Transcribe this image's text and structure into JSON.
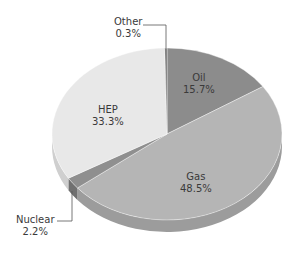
{
  "chart_data": {
    "type": "pie",
    "style": "3d",
    "title": "",
    "start_angle_deg": 0,
    "direction": "clockwise",
    "slices": [
      {
        "label": "Oil",
        "value": 15.7,
        "display": "15.7%",
        "color": "#8c8c8c",
        "side_color": "#6e6e6e"
      },
      {
        "label": "Gas",
        "value": 48.5,
        "display": "48.5%",
        "color": "#b5b5b5",
        "side_color": "#9c9c9c"
      },
      {
        "label": "Nuclear",
        "value": 2.2,
        "display": "2.2%",
        "color": "#8f8f8f",
        "side_color": "#707070"
      },
      {
        "label": "HEP",
        "value": 33.3,
        "display": "33.3%",
        "color": "#e8e8e8",
        "side_color": "#cfcfcf"
      },
      {
        "label": "Other",
        "value": 0.3,
        "display": "0.3%",
        "color": "#6a6a6a",
        "side_color": "#555555"
      }
    ],
    "callouts": [
      "Other",
      "Nuclear"
    ],
    "legend": "none"
  },
  "labels": {
    "oil": {
      "name": "Oil",
      "pct": "15.7%"
    },
    "gas": {
      "name": "Gas",
      "pct": "48.5%"
    },
    "nuclear": {
      "name": "Nuclear",
      "pct": "2.2%"
    },
    "hep": {
      "name": "HEP",
      "pct": "33.3%"
    },
    "other": {
      "name": "Other",
      "pct": "0.3%"
    }
  }
}
